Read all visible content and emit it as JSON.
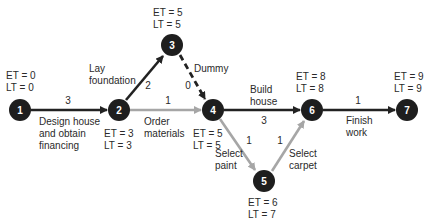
{
  "colors": {
    "node_fill": "#1e1e1e",
    "critical_edge": "#222222",
    "noncritical_edge": "#a6a6a6",
    "text": "#2a2a2a"
  },
  "nodes": [
    {
      "id": "1",
      "label": "1",
      "et": "ET = 0",
      "lt": "LT = 0"
    },
    {
      "id": "2",
      "label": "2",
      "et": "ET = 3",
      "lt": "LT = 3"
    },
    {
      "id": "3",
      "label": "3",
      "et": "ET = 5",
      "lt": "LT = 5"
    },
    {
      "id": "4",
      "label": "4",
      "et": "ET = 5",
      "lt": "LT = 5"
    },
    {
      "id": "5",
      "label": "5",
      "et": "ET = 6",
      "lt": "LT = 7"
    },
    {
      "id": "6",
      "label": "6",
      "et": "ET = 8",
      "lt": "LT = 8"
    },
    {
      "id": "7",
      "label": "7",
      "et": "ET = 9",
      "lt": "LT = 9"
    }
  ],
  "edges": [
    {
      "from": "1",
      "to": "2",
      "duration": "3",
      "activity": [
        "Design house",
        "and obtain",
        "financing"
      ],
      "style": "critical"
    },
    {
      "from": "2",
      "to": "3",
      "duration": "2",
      "activity": [
        "Lay",
        "foundation"
      ],
      "style": "critical"
    },
    {
      "from": "3",
      "to": "4",
      "duration": "0",
      "activity": [
        "Dummy"
      ],
      "style": "dummy"
    },
    {
      "from": "2",
      "to": "4",
      "duration": "1",
      "activity": [
        "Order",
        "materials"
      ],
      "style": "noncritical"
    },
    {
      "from": "4",
      "to": "6",
      "duration": "3",
      "activity": [
        "Build",
        "house"
      ],
      "style": "critical"
    },
    {
      "from": "4",
      "to": "5",
      "duration": "1",
      "activity": [
        "Select",
        "paint"
      ],
      "style": "noncritical"
    },
    {
      "from": "5",
      "to": "6",
      "duration": "1",
      "activity": [
        "Select",
        "carpet"
      ],
      "style": "noncritical"
    },
    {
      "from": "6",
      "to": "7",
      "duration": "1",
      "activity": [
        "Finish",
        "work"
      ],
      "style": "critical"
    }
  ]
}
